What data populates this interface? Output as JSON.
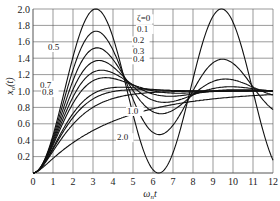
{
  "chart_data": {
    "type": "line",
    "title": "",
    "xlabel": "ωnt",
    "ylabel": "xo(t)",
    "xlim": [
      0,
      12
    ],
    "ylim": [
      0,
      2.0
    ],
    "grid": true,
    "x_ticks": [
      "0",
      "1",
      "2",
      "3",
      "4",
      "5",
      "6",
      "7",
      "8",
      "9",
      "10",
      "11",
      "12"
    ],
    "y_ticks": [
      "0.2",
      "0.4",
      "0.6",
      "0.8",
      "1.0",
      "1.2",
      "1.4",
      "1.6",
      "1.8",
      "2.0"
    ],
    "series": [
      {
        "name": "ζ=0",
        "zeta": 0.0,
        "peak_x": 3.14,
        "peak_y": 2.0
      },
      {
        "name": "0.1",
        "zeta": 0.1,
        "peak_x": 3.16,
        "peak_y": 1.73
      },
      {
        "name": "0.2",
        "zeta": 0.2,
        "peak_x": 3.21,
        "peak_y": 1.53
      },
      {
        "name": "0.3",
        "zeta": 0.3,
        "peak_x": 3.29,
        "peak_y": 1.37
      },
      {
        "name": "0.4",
        "zeta": 0.4,
        "peak_x": 3.43,
        "peak_y": 1.25
      },
      {
        "name": "0.5",
        "zeta": 0.5,
        "peak_x": 3.63,
        "peak_y": 1.16
      },
      {
        "name": "0.7",
        "zeta": 0.7,
        "peak_x": 4.4,
        "peak_y": 1.05
      },
      {
        "name": "0.8",
        "zeta": 0.8,
        "peak_x": 5.24,
        "peak_y": 1.02
      },
      {
        "name": "1.0",
        "zeta": 1.0,
        "peak_x": null,
        "peak_y": 1.0
      },
      {
        "name": "2.0",
        "zeta": 2.0,
        "peak_x": null,
        "peak_y": 1.0
      }
    ],
    "annotations": [
      {
        "text": "ζ=0",
        "x": 5.2,
        "y": 1.85
      },
      {
        "text": "0.1",
        "x": 5.2,
        "y": 1.72
      },
      {
        "text": "0.2",
        "x": 5.0,
        "y": 1.58
      },
      {
        "text": "0.3",
        "x": 5.0,
        "y": 1.45
      },
      {
        "text": "0.4",
        "x": 5.0,
        "y": 1.35
      },
      {
        "text": "0.5",
        "x": 0.75,
        "y": 1.5
      },
      {
        "text": "0.7",
        "x": 0.35,
        "y": 1.04
      },
      {
        "text": "0.8",
        "x": 0.45,
        "y": 0.95
      },
      {
        "text": "1.0",
        "x": 4.7,
        "y": 0.72
      },
      {
        "text": "2.0",
        "x": 4.2,
        "y": 0.4
      }
    ]
  }
}
